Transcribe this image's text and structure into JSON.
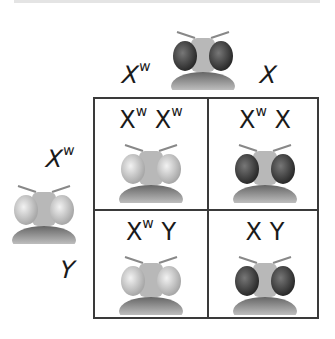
{
  "parents": {
    "male": {
      "alleles": [
        {
          "base": "X",
          "sup": "w"
        },
        {
          "base": "X",
          "sup": ""
        }
      ],
      "fly_eye_color": "red"
    },
    "female": {
      "alleles": [
        {
          "base": "X",
          "sup": "w"
        },
        {
          "base": "Y",
          "sup": ""
        }
      ],
      "fly_eye_color": "white"
    }
  },
  "offspring": [
    {
      "genotype": [
        {
          "base": "X",
          "sup": "w"
        },
        {
          "base": "X",
          "sup": "w"
        }
      ],
      "eye_color": "white"
    },
    {
      "genotype": [
        {
          "base": "X",
          "sup": "w"
        },
        {
          "base": "X",
          "sup": ""
        }
      ],
      "eye_color": "red"
    },
    {
      "genotype": [
        {
          "base": "X",
          "sup": "w"
        },
        {
          "base": "Y",
          "sup": ""
        }
      ],
      "eye_color": "white"
    },
    {
      "genotype": [
        {
          "base": "X",
          "sup": ""
        },
        {
          "base": "Y",
          "sup": ""
        }
      ],
      "eye_color": "red"
    }
  ],
  "colors": {
    "red_eye": "#3c3c3c",
    "white_eye": "#cfcfcf",
    "grid_line": "#3a3a3a"
  }
}
